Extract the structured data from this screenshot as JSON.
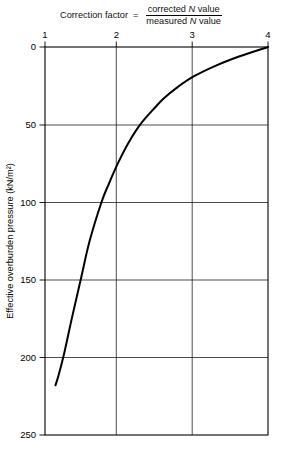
{
  "title": {
    "lhs": "Correction factor",
    "equals": "=",
    "numerator_pre": "corrected ",
    "numerator_var": "N",
    "numerator_post": " value",
    "denominator_pre": "measured ",
    "denominator_var": "N",
    "denominator_post": " value"
  },
  "axes": {
    "y_axis_title": "Effective overburden pressure (kN/m²)",
    "x_axis_title": ""
  },
  "chart_data": {
    "type": "line",
    "xlabel": "Correction factor",
    "ylabel": "Effective overburden pressure (kN/m²)",
    "xlim": [
      1,
      4
    ],
    "ylim": [
      0,
      250
    ],
    "y_inverted": true,
    "grid": true,
    "legend": "none",
    "x_ticks": [
      1,
      2,
      3,
      4
    ],
    "x_tick_labels": [
      "1",
      "2",
      "3",
      "4"
    ],
    "y_ticks": [
      0,
      50,
      100,
      150,
      200,
      250
    ],
    "y_tick_labels": [
      "0",
      "50",
      "100",
      "150",
      "200",
      "250"
    ],
    "x_axis_position": "top",
    "series": [
      {
        "name": "SPT N correction factor",
        "x": [
          4.0,
          3.62,
          3.3,
          3.0,
          2.78,
          2.6,
          2.48,
          2.28,
          2.12,
          1.98,
          1.86,
          1.76,
          1.6,
          1.48,
          1.36,
          1.26,
          1.18,
          1.14
        ],
        "y": [
          0,
          6,
          12,
          19,
          26,
          33,
          39,
          50,
          62,
          75,
          88,
          100,
          125,
          150,
          175,
          197,
          212,
          218
        ]
      }
    ]
  }
}
